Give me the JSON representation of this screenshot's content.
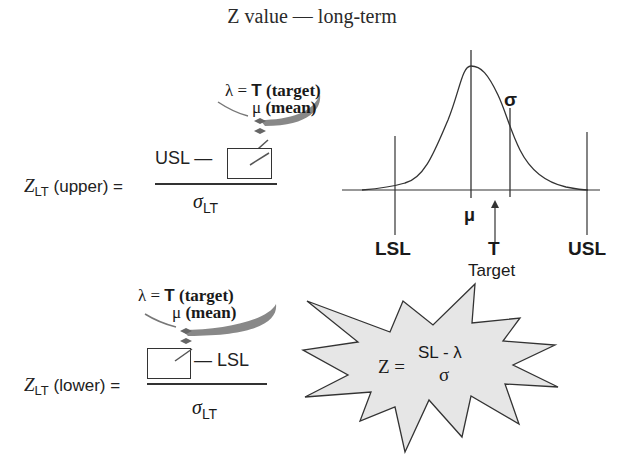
{
  "title": "Z value — long-term",
  "upper_formula": {
    "lhs_symbol": "Z",
    "lhs_subscript": "LT",
    "lhs_qualifier": "(upper) =",
    "numerator_term": "USL —",
    "denominator_symbol": "σ",
    "denominator_subscript": "LT",
    "callout": {
      "lambda": "λ =",
      "option1_symbol": "T",
      "option1_label": "(target)",
      "option2_symbol": "μ",
      "option2_label": "(mean)"
    }
  },
  "lower_formula": {
    "lhs_symbol": "Z",
    "lhs_subscript": "LT",
    "lhs_qualifier": "(lower) =",
    "numerator_term": "— LSL",
    "denominator_symbol": "σ",
    "denominator_subscript": "LT",
    "callout": {
      "lambda": "λ =",
      "option1_symbol": "T",
      "option1_label": "(target)",
      "option2_symbol": "μ",
      "option2_label": "(mean)"
    }
  },
  "distribution": {
    "sigma_label": "σ",
    "mean_label": "μ",
    "lsl_label": "LSL",
    "target_label": "T",
    "usl_label": "USL",
    "target_caption": "Target"
  },
  "starburst": {
    "lhs": "Z =",
    "numerator": "SL - λ",
    "denominator": "σ",
    "fill_color": "#e6e6e6"
  }
}
